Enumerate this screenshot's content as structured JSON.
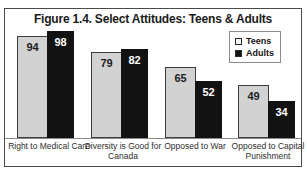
{
  "figure": {
    "title": "Figure 1.4. Select Attitudes: Teens & Adults"
  },
  "legend": {
    "position": "top-right",
    "items": [
      {
        "label": "Teens",
        "swatch": "legend-swatch-teens",
        "color": "#f2f2f2"
      },
      {
        "label": "Adults",
        "swatch": "legend-swatch-adults",
        "color": "#141414"
      }
    ]
  },
  "chart_data": {
    "type": "bar",
    "title": "Figure 1.4. Select Attitudes: Teens & Adults",
    "xlabel": "",
    "ylabel": "",
    "ylim": [
      0,
      100
    ],
    "grid": false,
    "legend_position": "top-right",
    "categories": [
      "Right to Medical Care",
      "Diversity is Good for Canada",
      "Opposed to War",
      "Opposed to Capital Punishment"
    ],
    "series": [
      {
        "name": "Teens",
        "color": "#d2d2d2",
        "values": [
          94,
          79,
          65,
          49
        ]
      },
      {
        "name": "Adults",
        "color": "#121212",
        "values": [
          98,
          82,
          52,
          34
        ]
      }
    ]
  }
}
